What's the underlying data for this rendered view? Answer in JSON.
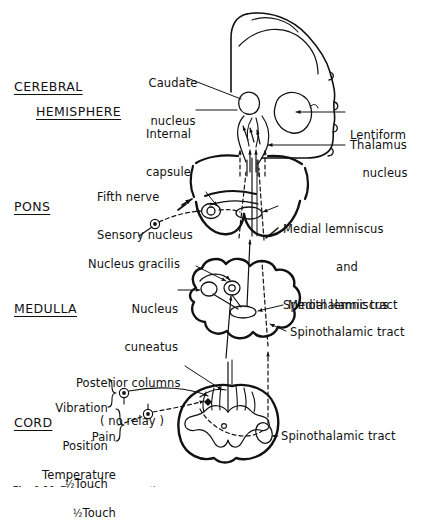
{
  "figure": {
    "caption_prefix": "Fig. 9.10.",
    "caption_text": "The main sensory pathways",
    "ink_color": "#111111",
    "background": "#ffffff"
  },
  "regions": [
    {
      "id": "cerebral",
      "line1": "CEREBRAL",
      "line2": "HEMISPHERE"
    },
    {
      "id": "pons",
      "label": "PONS"
    },
    {
      "id": "medulla",
      "label": "MEDULLA"
    },
    {
      "id": "cord",
      "label": "CORD"
    }
  ],
  "labels": {
    "caudate": {
      "line1": "Caudate",
      "line2": "nucleus"
    },
    "internal_capsule": {
      "line1": "Internal",
      "line2": "capsule"
    },
    "lentiform": {
      "line1": "Lentiform",
      "line2": "nucleus"
    },
    "thalamus": {
      "text": "Thalamus"
    },
    "fifth_nerve": {
      "line1": "Fifth nerve",
      "line2": "Sensory nucleus"
    },
    "medial_lemniscus_and_spinothalamic": {
      "line1": "Medial lemniscus",
      "line2": "and",
      "line3": "Spinothalamic tract"
    },
    "nucleus_gracilis": {
      "text": "Nucleus gracilis"
    },
    "nucleus_cuneatus": {
      "line1": "Nucleus",
      "line2": "cuneatus"
    },
    "medial_lemniscus": {
      "text": "Medial lemniscus"
    },
    "spinothalamic_tract_medulla": {
      "text": "Spinothalamic tract"
    },
    "posterior_columns": {
      "line1": "Posterior columns",
      "line2": "( no relay )"
    },
    "modality_dorsal": {
      "line1": "Vibration",
      "line2": "Position",
      "line3_fraction": "½",
      "line3_word": "Touch"
    },
    "modality_spinothalamic": {
      "line1": "Pain",
      "line2": "Temperature",
      "line3_fraction": "½",
      "line3_word": "Touch"
    },
    "spinothalamic_tract_cord": {
      "text": "Spinothalamic tract"
    }
  },
  "diagram_elements": {
    "cerebral_hemisphere": "cortex outline with scalloped gyri, caudate nucleus, lentiform nucleus, thalamus and internal capsule",
    "pons_section": "pons cross-section with fifth nerve sensory nucleus and medial lemniscus",
    "medulla_section": "medulla cross-section with nucleus gracilis, nucleus cuneatus, medial lemniscus and spinothalamic tract",
    "cord_section": "spinal cord cross-section with butterfly grey matter, posterior columns and spinothalamic tract",
    "solid_pathway": "dorsal column / medial lemniscus pathway",
    "dashed_pathway": "spinothalamic pathway",
    "ganglion_cells": "dorsal root ganglion cells shown as small filled circles"
  }
}
